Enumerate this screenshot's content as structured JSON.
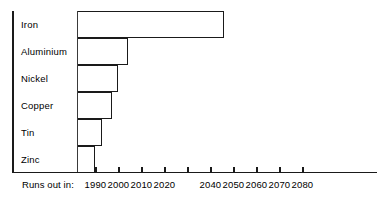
{
  "chart_data": {
    "type": "bar",
    "orientation": "horizontal",
    "title": "",
    "xlabel": "Runs out in:",
    "ylabel": "",
    "categories": [
      "Iron",
      "Aluminium",
      "Nickel",
      "Copper",
      "Tin",
      "Zinc"
    ],
    "values": [
      2046,
      2004,
      2000,
      1997,
      1993,
      1990
    ],
    "value_unit": "year",
    "xlim": [
      1982,
      2080
    ],
    "bar_start_year": 1982,
    "grid": false,
    "legend": null,
    "tick_values": [
      1990,
      2000,
      2010,
      2020,
      2030,
      2040,
      2050,
      2060,
      2070,
      2080
    ],
    "tick_labels": [
      "1990",
      "2000",
      "2010",
      "2020",
      "",
      "2040",
      "2050",
      "2060",
      "2070",
      "2080"
    ],
    "note": "The 2030 tick mark is drawn on the axis but its numeric label is absent in the source image."
  },
  "axis": {
    "caption": "Runs out in:"
  },
  "rows": [
    {
      "label": "Iron",
      "year": 2046
    },
    {
      "label": "Aluminium",
      "year": 2004
    },
    {
      "label": "Nickel",
      "year": 2000
    },
    {
      "label": "Copper",
      "year": 1997
    },
    {
      "label": "Tin",
      "year": 1993
    },
    {
      "label": "Zinc",
      "year": 1990
    }
  ],
  "colors": {
    "stroke": "#1a1a1a",
    "background": "#ffffff",
    "text": "#000000"
  }
}
